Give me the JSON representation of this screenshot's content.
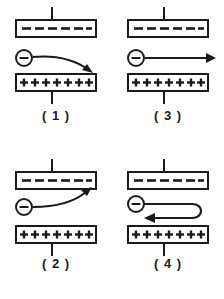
{
  "figure": {
    "background_color": "#ffffff",
    "ink_color": "#1a1a1a",
    "stroke_width": 2,
    "plate": {
      "top_plate_symbol": "-",
      "top_plate_symbol_count": 6,
      "top_plate_charge": "negative",
      "bottom_plate_symbol": "+",
      "bottom_plate_symbol_count": 7,
      "bottom_plate_charge": "positive",
      "top_plate_lead": "up",
      "bottom_plate_lead": "down"
    },
    "particle": {
      "symbol": "-",
      "name": "electron",
      "shape": "circle-with-minus"
    },
    "panels": [
      {
        "id": "panel-1",
        "label": "( 1 )",
        "position": "top-left",
        "arrow_name": "curve-down-right-arrow",
        "arrow_description": "Electron path curves downward to the right toward the positive plate",
        "arrow_direction": "right-and-down"
      },
      {
        "id": "panel-3",
        "label": "( 3 )",
        "position": "top-right",
        "arrow_name": "straight-right-arrow",
        "arrow_description": "Electron path goes straight to the right, undeflected",
        "arrow_direction": "right"
      },
      {
        "id": "panel-2",
        "label": "( 2 )",
        "position": "bottom-left",
        "arrow_name": "curve-up-right-arrow",
        "arrow_description": "Electron path curves upward to the right toward the negative plate",
        "arrow_direction": "right-and-up"
      },
      {
        "id": "panel-4",
        "label": "( 4 )",
        "position": "bottom-right",
        "arrow_name": "u-turn-left-arrow",
        "arrow_description": "Electron path goes right, reverses in a U-turn and returns to the left",
        "arrow_direction": "right-then-back-left"
      }
    ]
  }
}
